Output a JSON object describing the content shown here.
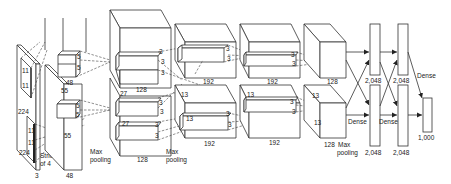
{
  "diagram": {
    "input": {
      "height": "224",
      "width": "224",
      "depth": "3",
      "kernel_a": "11",
      "kernel_b": "11",
      "stride_line1": "Stride",
      "stride_line2": "of 4"
    },
    "conv1": {
      "spatial": "55",
      "spatial_bottom": "55",
      "depth_top": "48",
      "depth_bottom": "48",
      "kernel_top_a": "5",
      "kernel_top_b": "5",
      "kernel_bottom_a": "5",
      "kernel_bottom_b": "5",
      "pool_line1": "Max",
      "pool_line2": "pooling"
    },
    "conv2": {
      "spatial_top": "27",
      "spatial_bottom": "27",
      "depth_top": "128",
      "depth_bottom": "128",
      "kernel_labels": [
        "3",
        "3",
        "3",
        "3",
        "3",
        "3",
        "3",
        "3"
      ],
      "pool_line1": "Max",
      "pool_line2": "pooling"
    },
    "conv3": {
      "spatial_top": "13",
      "spatial_bottom": "13",
      "depth_top": "192",
      "depth_bottom": "192",
      "kernel_labels": [
        "3",
        "3",
        "3",
        "3"
      ]
    },
    "conv4": {
      "spatial_top": "13",
      "depth_top": "192",
      "depth_bottom": "192",
      "kernel_labels": [
        "3",
        "3",
        "3",
        "3"
      ]
    },
    "conv5": {
      "spatial_a": "13",
      "spatial_b": "13",
      "depth_top": "128",
      "depth_bottom": "128",
      "pool_line1": "Max",
      "pool_line2": "pooling"
    },
    "dense": {
      "label": "Dense",
      "fc6_top": "2,048",
      "fc6_bottom": "2,048",
      "fc7_top": "2,048",
      "fc7_bottom": "2,048",
      "output": "1,000"
    }
  }
}
